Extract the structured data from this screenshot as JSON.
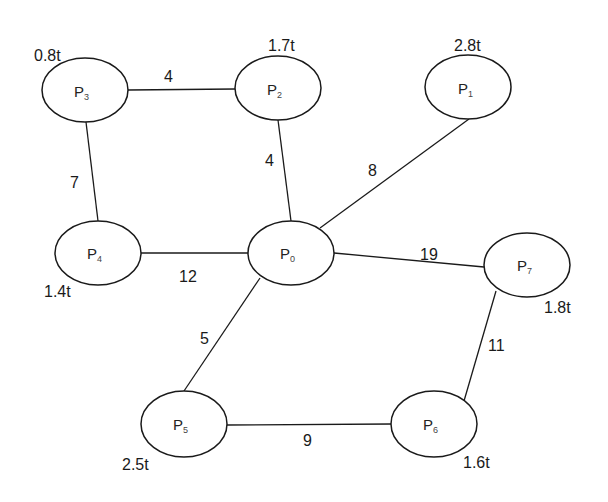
{
  "diagram": {
    "type": "weighted-undirected-graph",
    "nodes": [
      {
        "id": "P0",
        "base": "P",
        "sub": "0",
        "capacity": "",
        "cx": 291,
        "cy": 253
      },
      {
        "id": "P1",
        "base": "P",
        "sub": "1",
        "capacity": "2.8t",
        "cx": 468,
        "cy": 87
      },
      {
        "id": "P2",
        "base": "P",
        "sub": "2",
        "capacity": "1.7t",
        "cx": 278,
        "cy": 88
      },
      {
        "id": "P3",
        "base": "P",
        "sub": "3",
        "capacity": "0.8t",
        "cx": 85,
        "cy": 90
      },
      {
        "id": "P4",
        "base": "P",
        "sub": "4",
        "capacity": "1.4t",
        "cx": 98,
        "cy": 253
      },
      {
        "id": "P5",
        "base": "P",
        "sub": "5",
        "capacity": "2.5t",
        "cx": 184,
        "cy": 424
      },
      {
        "id": "P6",
        "base": "P",
        "sub": "6",
        "capacity": "1.6t",
        "cx": 434,
        "cy": 424
      },
      {
        "id": "P7",
        "base": "P",
        "sub": "7",
        "capacity": "1.8t",
        "cx": 527,
        "cy": 265
      }
    ],
    "edges": [
      {
        "from": "P3",
        "to": "P2",
        "weight": "4"
      },
      {
        "from": "P3",
        "to": "P4",
        "weight": "7"
      },
      {
        "from": "P2",
        "to": "P0",
        "weight": "4"
      },
      {
        "from": "P1",
        "to": "P0",
        "weight": "8"
      },
      {
        "from": "P4",
        "to": "P0",
        "weight": "12"
      },
      {
        "from": "P0",
        "to": "P7",
        "weight": "19"
      },
      {
        "from": "P0",
        "to": "P5",
        "weight": "5"
      },
      {
        "from": "P7",
        "to": "P6",
        "weight": "11"
      },
      {
        "from": "P5",
        "to": "P6",
        "weight": "9"
      }
    ]
  }
}
